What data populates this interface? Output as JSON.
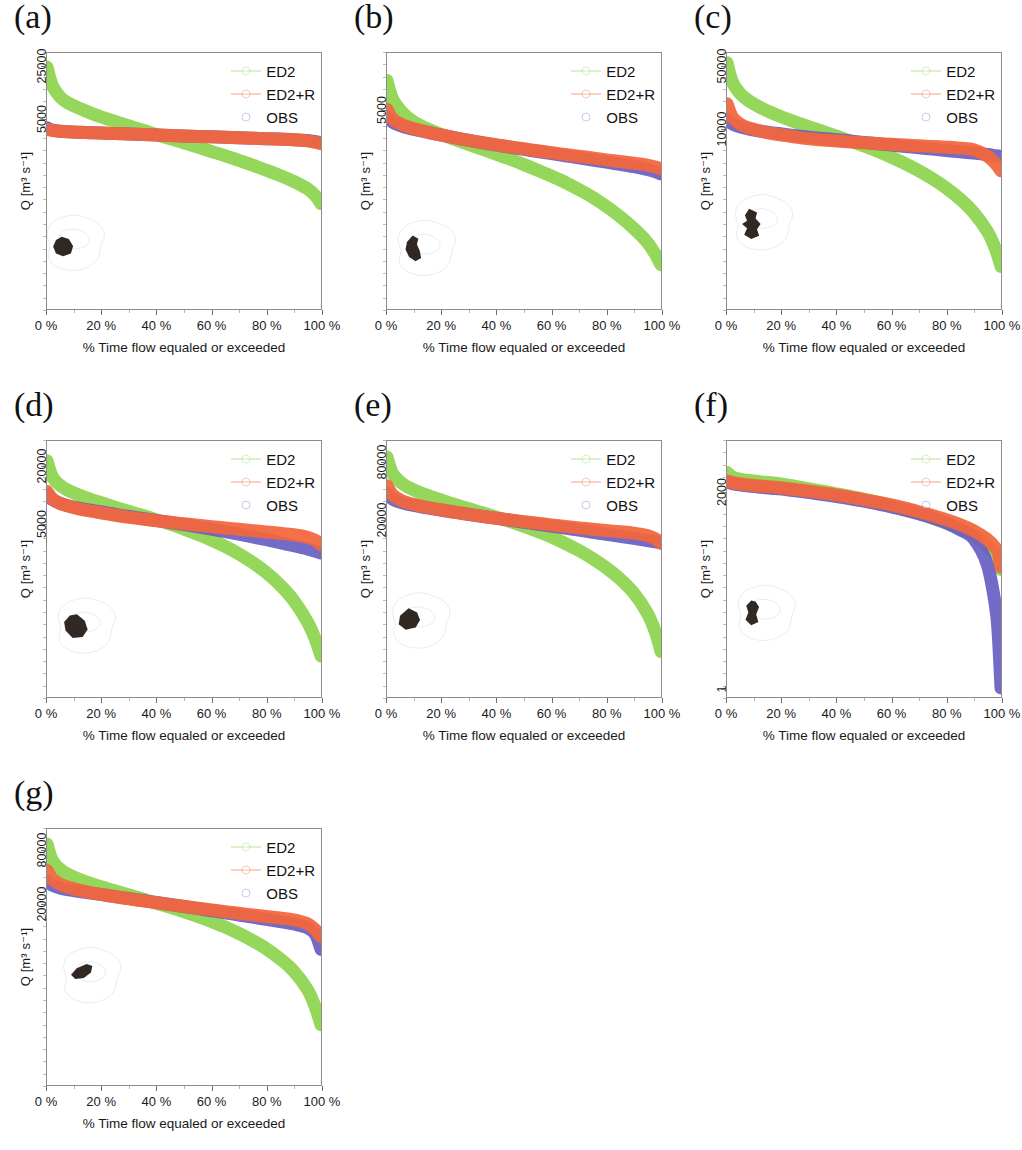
{
  "figure": {
    "axis": {
      "xlabel": "% Time flow equaled or exceeded",
      "ylabel": "Q [m³ s⁻¹]",
      "xticks": [
        "0 %",
        "20 %",
        "40 %",
        "60 %",
        "80 %",
        "100 %"
      ],
      "xtick_values": [
        0,
        20,
        40,
        60,
        80,
        100
      ]
    },
    "legend": {
      "entries": [
        {
          "label": "ED2",
          "color": "#8ed44f",
          "marker": "line-dot"
        },
        {
          "label": "ED2+R",
          "color": "#f4663c",
          "marker": "circle-dashed"
        },
        {
          "label": "OBS",
          "color": "#6a5fc4",
          "marker": "circle"
        }
      ]
    },
    "panels": [
      {
        "id": "a",
        "label": "(a)",
        "yticks": [
          "25000",
          "5000"
        ]
      },
      {
        "id": "b",
        "label": "(b)",
        "yticks": [
          "5000"
        ]
      },
      {
        "id": "c",
        "label": "(c)",
        "yticks": [
          "50000",
          "10000"
        ]
      },
      {
        "id": "d",
        "label": "(d)",
        "yticks": [
          "20000",
          "5000"
        ]
      },
      {
        "id": "e",
        "label": "(e)",
        "yticks": [
          "80000",
          "20000"
        ]
      },
      {
        "id": "f",
        "label": "(f)",
        "yticks": [
          "2000",
          "1"
        ]
      },
      {
        "id": "g",
        "label": "(g)",
        "yticks": [
          "80000",
          "20000"
        ]
      }
    ]
  },
  "chart_data": [
    {
      "type": "line",
      "panel": "a",
      "title": "(a)",
      "xlabel": "% Time flow equaled or exceeded",
      "ylabel": "Q [m³ s⁻¹]",
      "yscale": "log",
      "xlim": [
        0,
        100
      ],
      "ytick_labels": [
        "25000",
        "5000"
      ],
      "ytick_values": [
        25000,
        5000
      ],
      "ytick_pos": [
        0.055,
        0.26
      ],
      "grid": false,
      "legend_position": "top-right",
      "x": [
        0,
        2,
        5,
        8,
        12,
        16,
        20,
        25,
        30,
        35,
        40,
        45,
        50,
        55,
        60,
        65,
        70,
        75,
        80,
        85,
        90,
        95,
        98,
        100
      ],
      "series": [
        {
          "name": "ED2",
          "color": "#8ed44f",
          "values": [
            25000,
            14000,
            9800,
            8200,
            7000,
            6100,
            5400,
            4700,
            4100,
            3600,
            3150,
            2780,
            2450,
            2150,
            1880,
            1650,
            1430,
            1240,
            1060,
            900,
            750,
            600,
            480,
            380
          ]
        },
        {
          "name": "ED2+R",
          "color": "#f4663c",
          "values": [
            3700,
            3560,
            3480,
            3430,
            3380,
            3340,
            3300,
            3250,
            3200,
            3155,
            3110,
            3065,
            3020,
            2980,
            2940,
            2900,
            2860,
            2820,
            2780,
            2740,
            2690,
            2600,
            2480,
            2380
          ]
        },
        {
          "name": "OBS",
          "color": "#6a5fc4",
          "values": [
            3900,
            3620,
            3490,
            3435,
            3385,
            3345,
            3305,
            3255,
            3205,
            3160,
            3115,
            3070,
            3025,
            2985,
            2945,
            2905,
            2865,
            2825,
            2785,
            2745,
            2700,
            2630,
            2540,
            2460
          ]
        }
      ],
      "inset": {
        "cx": 0.11,
        "cy": 0.8
      }
    },
    {
      "type": "line",
      "panel": "b",
      "title": "(b)",
      "xlabel": "% Time flow equaled or exceeded",
      "ylabel": "Q [m³ s⁻¹]",
      "yscale": "log",
      "xlim": [
        0,
        100
      ],
      "ytick_labels": [
        "5000"
      ],
      "ytick_values": [
        5000
      ],
      "ytick_pos": [
        0.225
      ],
      "grid": false,
      "legend_position": "top-right",
      "x": [
        0,
        2,
        5,
        8,
        12,
        16,
        20,
        25,
        30,
        35,
        40,
        45,
        50,
        55,
        60,
        65,
        70,
        75,
        80,
        85,
        90,
        95,
        98,
        100
      ],
      "series": [
        {
          "name": "ED2",
          "color": "#8ed44f",
          "values": [
            9000,
            6300,
            5000,
            4300,
            3750,
            3400,
            3120,
            2830,
            2570,
            2340,
            2130,
            1930,
            1740,
            1560,
            1390,
            1230,
            1070,
            920,
            770,
            630,
            500,
            380,
            300,
            245
          ]
        },
        {
          "name": "ED2+R",
          "color": "#f4663c",
          "values": [
            5100,
            4250,
            3850,
            3620,
            3400,
            3230,
            3090,
            2930,
            2790,
            2670,
            2560,
            2460,
            2370,
            2280,
            2200,
            2120,
            2050,
            1980,
            1910,
            1850,
            1790,
            1720,
            1660,
            1600
          ]
        },
        {
          "name": "OBS",
          "color": "#6a5fc4",
          "values": [
            4450,
            4000,
            3720,
            3540,
            3370,
            3220,
            3090,
            2930,
            2790,
            2660,
            2545,
            2440,
            2340,
            2245,
            2155,
            2070,
            1985,
            1905,
            1825,
            1750,
            1670,
            1580,
            1510,
            1450
          ]
        }
      ],
      "inset": {
        "cx": 0.15,
        "cy": 0.82
      }
    },
    {
      "type": "line",
      "panel": "c",
      "title": "(c)",
      "xlabel": "% Time flow equaled or exceeded",
      "ylabel": "Q [m³ s⁻¹]",
      "yscale": "log",
      "xlim": [
        0,
        100
      ],
      "ytick_labels": [
        "50000",
        "10000"
      ],
      "ytick_values": [
        50000,
        10000
      ],
      "ytick_pos": [
        0.055,
        0.3
      ],
      "grid": false,
      "legend_position": "top-right",
      "x": [
        0,
        2,
        5,
        8,
        12,
        16,
        20,
        25,
        30,
        35,
        40,
        45,
        50,
        55,
        60,
        65,
        70,
        75,
        80,
        85,
        90,
        95,
        98,
        100
      ],
      "series": [
        {
          "name": "ED2",
          "color": "#8ed44f",
          "values": [
            56000,
            34000,
            25000,
            21000,
            17800,
            15600,
            13900,
            12200,
            10800,
            9600,
            8500,
            7500,
            6600,
            5750,
            4950,
            4200,
            3500,
            2850,
            2250,
            1700,
            1200,
            740,
            470,
            300
          ]
        },
        {
          "name": "ED2+R",
          "color": "#f4663c",
          "values": [
            19500,
            13800,
            11500,
            10500,
            9700,
            9150,
            8750,
            8300,
            7950,
            7700,
            7500,
            7320,
            7160,
            7020,
            6890,
            6760,
            6640,
            6520,
            6400,
            6250,
            6000,
            5100,
            4200,
            3500
          ]
        },
        {
          "name": "OBS",
          "color": "#6a5fc4",
          "values": [
            13000,
            11600,
            10700,
            10200,
            9700,
            9300,
            8980,
            8600,
            8280,
            8000,
            7760,
            7500,
            7250,
            7000,
            6760,
            6530,
            6310,
            6090,
            5880,
            5680,
            5500,
            5300,
            5150,
            5050
          ]
        }
      ],
      "inset": {
        "cx": 0.14,
        "cy": 0.72
      }
    },
    {
      "type": "line",
      "panel": "d",
      "title": "(d)",
      "xlabel": "% Time flow equaled or exceeded",
      "ylabel": "Q [m³ s⁻¹]",
      "yscale": "log",
      "xlim": [
        0,
        100
      ],
      "ytick_labels": [
        "20000",
        "5000"
      ],
      "ytick_values": [
        20000,
        5000
      ],
      "ytick_pos": [
        0.1,
        0.325
      ],
      "grid": false,
      "legend_position": "top-right",
      "x": [
        0,
        2,
        5,
        8,
        12,
        16,
        20,
        25,
        30,
        35,
        40,
        45,
        50,
        55,
        60,
        65,
        70,
        75,
        80,
        85,
        90,
        95,
        98,
        100
      ],
      "series": [
        {
          "name": "ED2",
          "color": "#8ed44f",
          "values": [
            23000,
            15500,
            12600,
            11200,
            10000,
            9100,
            8350,
            7500,
            6780,
            6150,
            5550,
            5000,
            4450,
            3930,
            3420,
            2930,
            2450,
            1990,
            1560,
            1160,
            800,
            480,
            310,
            210
          ]
        },
        {
          "name": "ED2+R",
          "color": "#f4663c",
          "values": [
            11000,
            9200,
            8200,
            7700,
            7200,
            6850,
            6550,
            6200,
            5900,
            5650,
            5430,
            5230,
            5050,
            4880,
            4720,
            4570,
            4420,
            4280,
            4150,
            4020,
            3880,
            3650,
            3380,
            3050
          ]
        },
        {
          "name": "OBS",
          "color": "#6a5fc4",
          "values": [
            10300,
            9000,
            8200,
            7750,
            7320,
            6990,
            6700,
            6330,
            6010,
            5730,
            5470,
            5210,
            4950,
            4690,
            4430,
            4180,
            3930,
            3680,
            3440,
            3200,
            2980,
            2760,
            2600,
            2500
          ]
        }
      ],
      "inset": {
        "cx": 0.15,
        "cy": 0.78
      }
    },
    {
      "type": "line",
      "panel": "e",
      "title": "(e)",
      "xlabel": "% Time flow equaled or exceeded",
      "ylabel": "Q [m³ s⁻¹]",
      "yscale": "log",
      "xlim": [
        0,
        100
      ],
      "ytick_labels": [
        "80000",
        "20000"
      ],
      "ytick_values": [
        80000,
        20000
      ],
      "ytick_pos": [
        0.085,
        0.31
      ],
      "grid": false,
      "legend_position": "top-right",
      "x": [
        0,
        2,
        5,
        8,
        12,
        16,
        20,
        25,
        30,
        35,
        40,
        45,
        50,
        55,
        60,
        65,
        70,
        75,
        80,
        85,
        90,
        95,
        98,
        100
      ],
      "series": [
        {
          "name": "ED2",
          "color": "#8ed44f",
          "values": [
            92000,
            62000,
            50000,
            44000,
            39000,
            35500,
            32500,
            29200,
            26400,
            23900,
            21600,
            19400,
            17300,
            15300,
            13400,
            11500,
            9700,
            8000,
            6400,
            4900,
            3500,
            2150,
            1350,
            850
          ]
        },
        {
          "name": "ED2+R",
          "color": "#f4663c",
          "values": [
            46000,
            37000,
            32500,
            30300,
            28300,
            26900,
            25700,
            24300,
            23100,
            22000,
            21050,
            20200,
            19400,
            18650,
            17950,
            17300,
            16700,
            16150,
            15650,
            15200,
            14700,
            13900,
            12800,
            11500
          ]
        },
        {
          "name": "OBS",
          "color": "#6a5fc4",
          "values": [
            38000,
            33500,
            30800,
            29300,
            27800,
            26600,
            25500,
            24200,
            23050,
            21980,
            20980,
            20030,
            19120,
            18240,
            17400,
            16590,
            15800,
            15040,
            14300,
            13600,
            12950,
            12300,
            11900,
            11600
          ]
        }
      ],
      "inset": {
        "cx": 0.13,
        "cy": 0.76
      }
    },
    {
      "type": "line",
      "panel": "f",
      "title": "(f)",
      "xlabel": "% Time flow equaled or exceeded",
      "ylabel": "Q [m³ s⁻¹]",
      "yscale": "log",
      "xlim": [
        0,
        100
      ],
      "ytick_labels": [
        "2000",
        "1"
      ],
      "ytick_values": [
        2000,
        1
      ],
      "ytick_pos": [
        0.2,
        0.965
      ],
      "grid": false,
      "legend_position": "top-right",
      "x": [
        0,
        2,
        5,
        8,
        12,
        16,
        20,
        25,
        30,
        35,
        40,
        45,
        50,
        55,
        60,
        65,
        70,
        75,
        80,
        85,
        90,
        95,
        98,
        99,
        100
      ],
      "series": [
        {
          "name": "ED2",
          "color": "#8ed44f",
          "values": [
            4300,
            3600,
            3300,
            3150,
            3000,
            2880,
            2740,
            2500,
            2280,
            2080,
            1880,
            1700,
            1520,
            1350,
            1180,
            1020,
            870,
            730,
            600,
            480,
            370,
            250,
            175,
            140,
            100
          ]
        },
        {
          "name": "ED2+R",
          "color": "#f4663c",
          "values": [
            3100,
            2900,
            2750,
            2650,
            2550,
            2460,
            2360,
            2220,
            2080,
            1940,
            1800,
            1650,
            1500,
            1360,
            1220,
            1080,
            940,
            810,
            690,
            570,
            450,
            320,
            230,
            190,
            110
          ]
        },
        {
          "name": "OBS",
          "color": "#6a5fc4",
          "values": [
            3000,
            2780,
            2630,
            2530,
            2430,
            2340,
            2250,
            2110,
            1970,
            1830,
            1690,
            1550,
            1410,
            1270,
            1130,
            1000,
            870,
            740,
            610,
            470,
            330,
            120,
            24,
            8,
            1
          ]
        }
      ],
      "inset": {
        "cx": 0.15,
        "cy": 0.73
      }
    },
    {
      "type": "line",
      "panel": "g",
      "title": "(g)",
      "xlabel": "% Time flow equaled or exceeded",
      "ylabel": "Q [m³ s⁻¹]",
      "yscale": "log",
      "xlim": [
        0,
        100
      ],
      "ytick_labels": [
        "80000",
        "20000"
      ],
      "ytick_values": [
        80000,
        20000
      ],
      "ytick_pos": [
        0.085,
        0.295
      ],
      "grid": false,
      "legend_position": "top-right",
      "x": [
        0,
        2,
        5,
        8,
        12,
        16,
        20,
        25,
        30,
        35,
        40,
        45,
        50,
        55,
        60,
        65,
        70,
        75,
        80,
        85,
        90,
        95,
        98,
        100
      ],
      "series": [
        {
          "name": "ED2",
          "color": "#8ed44f",
          "values": [
            95000,
            62000,
            49000,
            43000,
            38000,
            34500,
            31500,
            28300,
            25500,
            23000,
            20700,
            18600,
            16600,
            14700,
            12900,
            11200,
            9500,
            7900,
            6400,
            4950,
            3600,
            2250,
            1400,
            900
          ]
        },
        {
          "name": "ED2+R",
          "color": "#f4663c",
          "values": [
            48000,
            38500,
            33500,
            31000,
            28800,
            27200,
            25900,
            24400,
            23100,
            21950,
            20900,
            19950,
            19050,
            18200,
            17400,
            16650,
            15950,
            15300,
            14700,
            14150,
            13500,
            12200,
            10400,
            8800
          ]
        },
        {
          "name": "OBS",
          "color": "#6a5fc4",
          "values": [
            37000,
            32800,
            30500,
            29200,
            27900,
            26800,
            25800,
            24500,
            23300,
            22150,
            21050,
            20000,
            18980,
            18000,
            17050,
            16150,
            15280,
            14450,
            13650,
            12880,
            12100,
            11000,
            9200,
            6300
          ]
        }
      ],
      "inset": {
        "cx": 0.17,
        "cy": 0.63
      }
    }
  ]
}
